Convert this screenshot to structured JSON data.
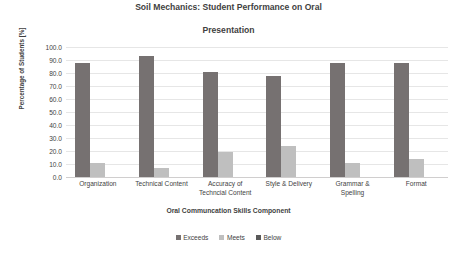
{
  "chart_data": {
    "type": "bar",
    "title": "Soil Mechanics: Student Performance on Oral Presentation",
    "title_line1": "Soil Mechanics: Student Performance on Oral",
    "title_line2": "Presentation",
    "xlabel": "Oral Communcation Skills Component",
    "ylabel": "Percentage of Students [%]",
    "ylim": [
      0,
      100
    ],
    "ytick_labels": [
      "100.0",
      "90.0",
      "80.0",
      "70.0",
      "60.0",
      "50.0",
      "40.0",
      "30.0",
      "20.0",
      "10.0",
      "0.0"
    ],
    "ytick_values": [
      100,
      90,
      80,
      70,
      60,
      50,
      40,
      30,
      20,
      10,
      0
    ],
    "grid": true,
    "legend_position": "bottom",
    "categories": [
      "Organization",
      "Technical Content",
      "Accuracy of Techncial Content",
      "Style & Delivery",
      "Grammar & Spelling",
      "Format"
    ],
    "category_lines": [
      [
        "Organization"
      ],
      [
        "Technical Content"
      ],
      [
        "Accuracy of",
        "Techncial Content"
      ],
      [
        "Style & Delivery"
      ],
      [
        "Grammar &",
        "Spelling"
      ],
      [
        "Format"
      ]
    ],
    "series": [
      {
        "name": "Exceeds",
        "color": "#767171",
        "values": [
          88,
          93,
          81,
          78,
          88,
          88
        ]
      },
      {
        "name": "Meets",
        "color": "#bfbfbf",
        "values": [
          11,
          7,
          19,
          24,
          11,
          14
        ]
      },
      {
        "name": "Below",
        "color": "#595959",
        "values": [
          0,
          0,
          0,
          0,
          0,
          0
        ]
      }
    ]
  }
}
